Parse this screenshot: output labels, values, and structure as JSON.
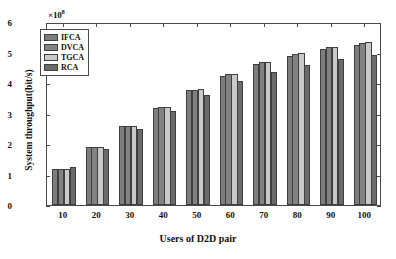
{
  "chart_data": {
    "type": "bar",
    "title": "",
    "xlabel": "Users of D2D pair",
    "ylabel": "System throughput(bit/s)",
    "y_multiplier": "×10",
    "y_multiplier_exp": "8",
    "categories": [
      "10",
      "20",
      "30",
      "40",
      "50",
      "60",
      "70",
      "80",
      "90",
      "100"
    ],
    "xtick_labels": [
      "10",
      "20",
      "30",
      "40",
      "50",
      "60",
      "70",
      "80",
      "90",
      "100"
    ],
    "ytick_labels": [
      "0",
      "1",
      "2",
      "3",
      "4",
      "5",
      "6"
    ],
    "ylim": [
      0,
      6
    ],
    "xlim": [
      0,
      10
    ],
    "grid": false,
    "legend_position": "top-left",
    "series": [
      {
        "name": "IFCA",
        "color": "#7d7d7d",
        "values": [
          1.18,
          1.9,
          2.58,
          3.18,
          3.76,
          4.24,
          4.62,
          4.89,
          5.13,
          5.26
        ]
      },
      {
        "name": "DVCA",
        "color": "#828282",
        "values": [
          1.18,
          1.9,
          2.58,
          3.2,
          3.78,
          4.3,
          4.68,
          4.96,
          5.17,
          5.3
        ]
      },
      {
        "name": "TGCA",
        "color": "#c9c9c9",
        "values": [
          1.18,
          1.9,
          2.58,
          3.21,
          3.8,
          4.31,
          4.69,
          4.98,
          5.19,
          5.33
        ]
      },
      {
        "name": "RCA",
        "color": "#6b6b6b",
        "values": [
          1.24,
          1.85,
          2.49,
          3.09,
          3.62,
          4.05,
          4.35,
          4.58,
          4.78,
          4.93
        ]
      }
    ]
  }
}
